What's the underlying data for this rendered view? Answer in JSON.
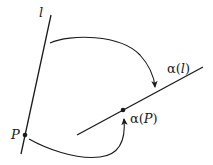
{
  "diagram": {
    "title": "",
    "line_l": {
      "label": "l",
      "start": [
        51,
        15
      ],
      "end": [
        21,
        154
      ]
    },
    "point_P": {
      "label": "P",
      "position": [
        25,
        135
      ]
    },
    "line_alpha_l": {
      "label_prefix": "α(",
      "label_var": "l",
      "label_suffix": ")",
      "start": [
        77,
        135
      ],
      "end": [
        203,
        67
      ]
    },
    "point_alpha_P": {
      "label_prefix": "α(",
      "label_var": "P",
      "label_suffix": ")",
      "position": [
        123,
        110
      ]
    },
    "arrows": [
      {
        "from": "line l",
        "to": "α(l)",
        "description": "maps line l to α(l)"
      },
      {
        "from": "P",
        "to": "α(P)",
        "description": "maps point P to α(P)"
      }
    ],
    "colors": {
      "stroke": "#1a1a1a",
      "background": "#ffffff"
    }
  }
}
